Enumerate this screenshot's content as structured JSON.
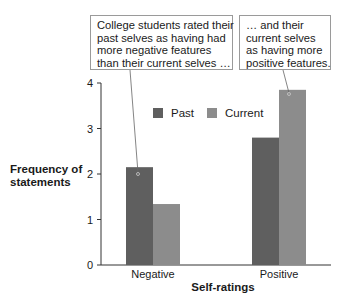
{
  "chart_data": {
    "type": "bar",
    "title": "",
    "categories": [
      "Negative",
      "Positive"
    ],
    "series": [
      {
        "name": "Past",
        "values": [
          2.15,
          2.8
        ],
        "color": "#5f5f5f"
      },
      {
        "name": "Current",
        "values": [
          1.34,
          3.85
        ],
        "color": "#8c8c8c"
      }
    ],
    "xlabel": "Self-ratings",
    "ylabel": "Frequency of statements",
    "ylabel_lines": [
      "Frequency of",
      "statements"
    ],
    "ylim": [
      0,
      4
    ],
    "yticks": [
      "0",
      "1",
      "2",
      "3",
      "4"
    ],
    "grid": false,
    "legend_position": "top-center inside plot",
    "annotations": [
      {
        "lines": [
          "College students rated their",
          "past selves as having had",
          "more negative features",
          "than their current selves …"
        ],
        "points_to": "Negative / Past"
      },
      {
        "lines": [
          "… and their",
          "current selves",
          "as having more",
          "positive features."
        ],
        "points_to": "Positive / Current"
      }
    ]
  }
}
